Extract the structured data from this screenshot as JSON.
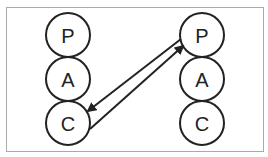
{
  "diagram": {
    "left_column": {
      "nodes": [
        {
          "label": "P"
        },
        {
          "label": "A"
        },
        {
          "label": "C"
        }
      ]
    },
    "right_column": {
      "nodes": [
        {
          "label": "P"
        },
        {
          "label": "A"
        },
        {
          "label": "C"
        }
      ]
    },
    "edges": [
      {
        "from": "right.P",
        "to": "left.C"
      },
      {
        "from": "left.C",
        "to": "right.P"
      }
    ],
    "colors": {
      "stroke": "#222222",
      "border": "#aaaaaa",
      "background": "#ffffff"
    }
  }
}
